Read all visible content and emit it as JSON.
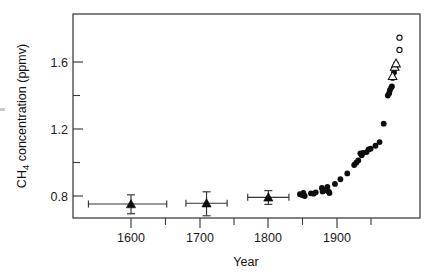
{
  "figure": {
    "background": "#ffffff",
    "frame_color": "#3a3a3a"
  },
  "chart_data": {
    "type": "scatter",
    "title": "",
    "subtitle": "",
    "xlabel": "Year",
    "ylabel": "CH4 concentration (ppmv)",
    "ylabel_parts": {
      "prefix": "CH",
      "subscript": "4",
      "suffix": " concentration (ppmv)"
    },
    "xlim": [
      1550,
      2000
    ],
    "ylim": [
      0.66,
      1.78
    ],
    "grid": false,
    "legend": "none",
    "xticks": [
      1600,
      1700,
      1800,
      1900
    ],
    "xtick_labels": [
      "1600",
      "1700",
      "1800",
      "1900"
    ],
    "xticks_minor": [
      1650,
      1750,
      1850,
      1950
    ],
    "yticks": [
      0.8,
      1.2,
      1.6
    ],
    "ytick_labels": [
      "0.8",
      "1.2",
      "1.6"
    ],
    "yticks_minor": [
      1.0,
      1.4
    ],
    "series": [
      {
        "name": "ice-core-triangles-with-error-bars",
        "marker": "filled-triangle",
        "points": [
          {
            "x": 1600,
            "y": 0.752,
            "yerr_low": 0.058,
            "yerr_high": 0.055,
            "xerr_low": 62,
            "xerr_high": 52
          },
          {
            "x": 1710,
            "y": 0.757,
            "yerr_low": 0.075,
            "yerr_high": 0.068,
            "xerr_low": 30,
            "xerr_high": 30
          },
          {
            "x": 1800,
            "y": 0.792,
            "yerr_low": 0.042,
            "yerr_high": 0.04,
            "xerr_low": 30,
            "xerr_high": 30
          }
        ]
      },
      {
        "name": "ice-core-filled-circles",
        "marker": "filled-circle",
        "points": [
          {
            "x": 1846,
            "y": 0.811
          },
          {
            "x": 1849,
            "y": 0.806
          },
          {
            "x": 1851,
            "y": 0.818
          },
          {
            "x": 1853,
            "y": 0.8
          },
          {
            "x": 1862,
            "y": 0.816
          },
          {
            "x": 1866,
            "y": 0.814
          },
          {
            "x": 1869,
            "y": 0.822
          },
          {
            "x": 1878,
            "y": 0.848
          },
          {
            "x": 1879,
            "y": 0.827
          },
          {
            "x": 1881,
            "y": 0.833
          },
          {
            "x": 1886,
            "y": 0.855
          },
          {
            "x": 1888,
            "y": 0.826
          },
          {
            "x": 1889,
            "y": 0.818
          },
          {
            "x": 1897,
            "y": 0.872
          },
          {
            "x": 1905,
            "y": 0.9
          },
          {
            "x": 1915,
            "y": 0.935
          },
          {
            "x": 1925,
            "y": 0.985
          },
          {
            "x": 1928,
            "y": 0.999
          },
          {
            "x": 1931,
            "y": 1.012
          },
          {
            "x": 1934,
            "y": 1.055
          },
          {
            "x": 1936,
            "y": 1.043
          },
          {
            "x": 1938,
            "y": 1.058
          },
          {
            "x": 1943,
            "y": 1.062
          },
          {
            "x": 1946,
            "y": 1.078
          },
          {
            "x": 1949,
            "y": 1.082
          },
          {
            "x": 1956,
            "y": 1.1
          },
          {
            "x": 1962,
            "y": 1.122
          },
          {
            "x": 1968,
            "y": 1.232
          },
          {
            "x": 1974,
            "y": 1.4
          },
          {
            "x": 1976,
            "y": 1.414
          },
          {
            "x": 1977,
            "y": 1.432
          },
          {
            "x": 1979,
            "y": 1.448
          },
          {
            "x": 1980,
            "y": 1.455
          },
          {
            "x": 1981,
            "y": 1.505
          },
          {
            "x": 1983,
            "y": 1.538
          },
          {
            "x": 1984,
            "y": 1.56
          },
          {
            "x": 1985,
            "y": 1.578
          },
          {
            "x": 1986,
            "y": 1.588
          }
        ]
      },
      {
        "name": "open-triangles",
        "marker": "open-triangle",
        "points": [
          {
            "x": 1981,
            "y": 1.516
          },
          {
            "x": 1984,
            "y": 1.572
          },
          {
            "x": 1986,
            "y": 1.592
          }
        ]
      },
      {
        "name": "open-circles",
        "marker": "open-circle",
        "points": [
          {
            "x": 1991,
            "y": 1.745
          },
          {
            "x": 1991,
            "y": 1.672
          }
        ]
      }
    ]
  }
}
